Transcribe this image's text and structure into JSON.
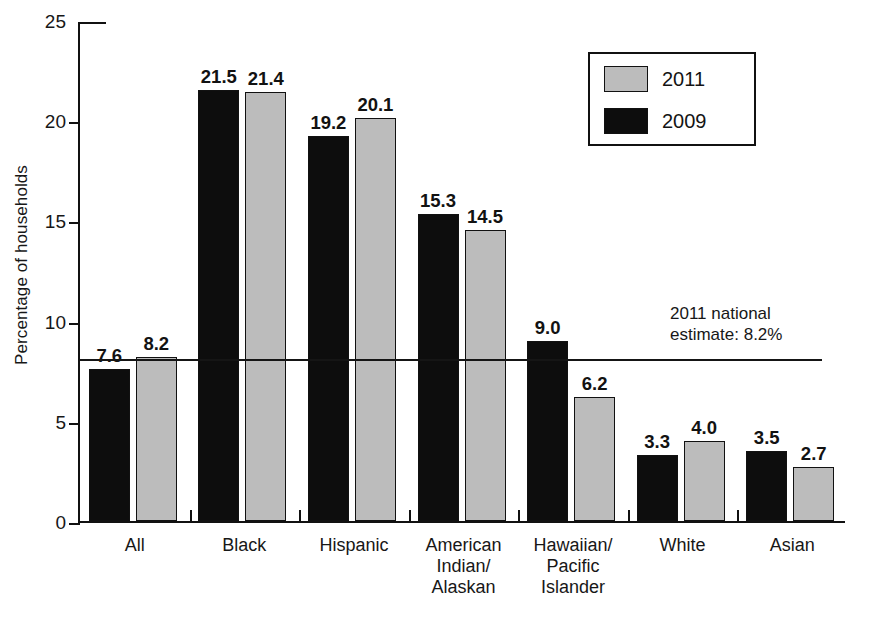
{
  "chart_data": {
    "type": "bar",
    "title": "",
    "subtitle": "",
    "xlabel": "",
    "ylabel": "Percentage of households",
    "ylim": [
      0,
      25
    ],
    "yticks": [
      0,
      5,
      10,
      15,
      20,
      25
    ],
    "ytick_labels": [
      "0",
      "5",
      "10",
      "15",
      "20",
      "25"
    ],
    "grid": false,
    "legend_position": "top-right",
    "categories": [
      "All",
      "Black",
      "Hispanic",
      "American\nIndian/\nAlaskan",
      "Hawaiian/\nPacific\nIslander",
      "White",
      "Asian"
    ],
    "series": [
      {
        "name": "2009",
        "color": "#0d0d0d",
        "values": [
          7.6,
          21.5,
          19.2,
          15.3,
          9.0,
          3.3,
          3.5
        ],
        "labels": [
          "7.6",
          "21.5",
          "19.2",
          "15.3",
          "9.0",
          "3.3",
          "3.5"
        ]
      },
      {
        "name": "2011",
        "color": "#bcbcbc",
        "values": [
          8.2,
          21.4,
          20.1,
          14.5,
          6.2,
          4.0,
          2.7
        ],
        "labels": [
          "8.2",
          "21.4",
          "20.1",
          "14.5",
          "6.2",
          "4.0",
          "2.7"
        ]
      }
    ],
    "annotations": [
      {
        "name": "national-estimate-line",
        "type": "hline",
        "value": 8.2,
        "text": "2011 national\nestimate: 8.2%"
      }
    ]
  },
  "legend": {
    "items": [
      {
        "label": "2011",
        "color": "#bcbcbc"
      },
      {
        "label": "2009",
        "color": "#0d0d0d"
      }
    ]
  },
  "annotation": {
    "text": "2011 national\nestimate: 8.2%"
  }
}
